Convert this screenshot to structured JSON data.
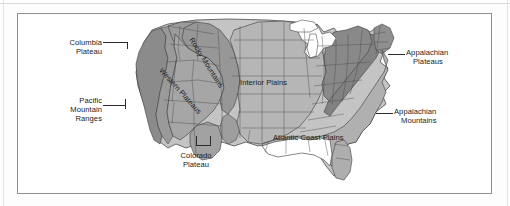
{
  "map": {
    "title": "Physiographic Regions of the United States",
    "frame": {
      "x": 17,
      "y": 13,
      "width": 475,
      "height": 181
    },
    "background_color": "#ffffff",
    "outline_color": "#3a3a3a",
    "labels": [
      {
        "id": "columbia-plateau",
        "text": "Columbia\nPlateau",
        "lines": [
          "Columbia",
          "Plateau"
        ],
        "x": 84,
        "y": 28,
        "align": "right",
        "rotation": 0
      },
      {
        "id": "pacific-mountain-ranges",
        "text": "Pacific\nMountain\nRanges",
        "lines": [
          "Pacific",
          "Mountain",
          "Ranges"
        ],
        "x": 84,
        "y": 86,
        "align": "right",
        "rotation": 0
      },
      {
        "id": "rocky-mountains",
        "text": "Rocky Mountains",
        "lines": [
          "Rocky Mountains"
        ],
        "x": 177,
        "y": 22,
        "align": "left",
        "rotation": 58
      },
      {
        "id": "western-plateaus",
        "text": "Western Plateaus",
        "lines": [
          "Western Plateaus"
        ],
        "x": 147,
        "y": 55,
        "align": "left",
        "rotation": 48
      },
      {
        "id": "interior-plains",
        "text": "Interior Plains",
        "lines": [
          "Interior Plains"
        ],
        "x": 222,
        "y": 68,
        "align": "left",
        "rotation": 0
      },
      {
        "id": "colorado-plateau",
        "text": "Colorado\nPlateau",
        "lines": [
          "Colorado",
          "Plateau"
        ],
        "x": 168,
        "y": 140,
        "align": "left",
        "rotation": 0
      },
      {
        "id": "atlantic-coast-plains",
        "text": "Atlantic Coast Plains",
        "lines": [
          "Atlantic Coast Plains"
        ],
        "x": 257,
        "y": 123,
        "align": "left",
        "rotation": 0
      },
      {
        "id": "appalachian-plateaus",
        "text": "Appalachian\nPlateaus",
        "lines": [
          "Appalachian",
          "Plateaus"
        ],
        "x": 388,
        "y": 38,
        "align": "left",
        "rotation": 0
      },
      {
        "id": "appalachian-mountains",
        "text": "Appalachian\nMountains",
        "lines": [
          "Appalachian",
          "Mountains"
        ],
        "x": 376,
        "y": 97,
        "align": "left",
        "rotation": 0
      }
    ],
    "legend_regions": [
      {
        "name": "Pacific Mountain Ranges",
        "shade": "#8e8e8e"
      },
      {
        "name": "Columbia Plateau",
        "shade": "#9d9d9d"
      },
      {
        "name": "Western Plateaus",
        "shade": "#a8a8a8"
      },
      {
        "name": "Rocky Mountains",
        "shade": "#9a9a9a"
      },
      {
        "name": "Colorado Plateau",
        "shade": "#a0a0a0"
      },
      {
        "name": "Interior Plains",
        "shade": "#b7b7b7"
      },
      {
        "name": "Appalachian Plateaus",
        "shade": "#8a8a8a"
      },
      {
        "name": "Appalachian Mountains",
        "shade": "#8a8a8a"
      },
      {
        "name": "Atlantic Coast Plains",
        "shade": "#b2b2b2"
      },
      {
        "name": "Great Lakes / Water",
        "shade": "#ffffff"
      }
    ]
  }
}
